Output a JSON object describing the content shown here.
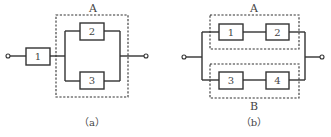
{
  "diagram_a": {
    "caption": "（a）",
    "group_label": "A",
    "components": [
      "1",
      "2",
      "3"
    ],
    "description": "Component 1 in series with group A, where A is components 2 and 3 in parallel"
  },
  "diagram_b": {
    "caption": "（b）",
    "group_labels": {
      "top": "A",
      "bottom": "B"
    },
    "components": [
      "1",
      "2",
      "3",
      "4"
    ],
    "description": "Group A (1 and 2 in series) in parallel with group B (3 and 4 in series)"
  },
  "colors": {
    "line": "#333333",
    "text": "#444444",
    "background": "#ffffff"
  }
}
